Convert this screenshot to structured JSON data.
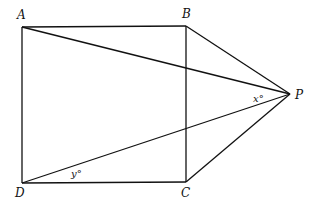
{
  "diagram": {
    "points": {
      "A": {
        "label": "A",
        "x": 22,
        "y": 27
      },
      "B": {
        "label": "B",
        "x": 186,
        "y": 26
      },
      "C": {
        "label": "C",
        "x": 186,
        "y": 182
      },
      "D": {
        "label": "D",
        "x": 22,
        "y": 183
      },
      "P": {
        "label": "P",
        "x": 290,
        "y": 94
      }
    },
    "segments": [
      "AB",
      "BC",
      "CD",
      "DA",
      "AP",
      "BP",
      "CP",
      "DP"
    ],
    "angles": {
      "x": {
        "label": "x°",
        "vertex": "P",
        "between": [
          "AP",
          "DP"
        ]
      },
      "y": {
        "label": "y°",
        "vertex": "D",
        "between": [
          "DC",
          "DP"
        ]
      }
    },
    "line_color": "#111111"
  }
}
